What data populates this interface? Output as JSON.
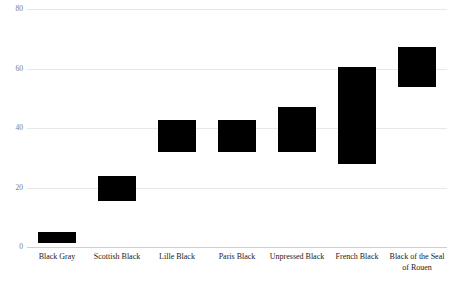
{
  "chart_data": {
    "type": "bar",
    "title": "",
    "subtitle": "",
    "xlabel": "",
    "ylabel": "",
    "ylim": [
      0,
      80
    ],
    "yticks": [
      0,
      20,
      40,
      60,
      80
    ],
    "grid": true,
    "legend": "none",
    "orientation": "vertical",
    "bar_style": "floating-range",
    "categories": [
      "Black Gray",
      "Scottish Black",
      "Lille Black",
      "Paris Black",
      "Unpressed Black",
      "French Black",
      "Black of the Seal of Rouen"
    ],
    "series": [
      {
        "name": "range-low",
        "values": [
          1.3,
          15.4,
          31.9,
          31.9,
          31.9,
          27.9,
          53.7
        ]
      },
      {
        "name": "range-high",
        "values": [
          5.0,
          23.8,
          42.6,
          42.6,
          47.0,
          60.4,
          67.1
        ]
      }
    ],
    "bar_color": "#000000",
    "grid_color": "#e8e8e8",
    "axis_color": "#d0d0d0",
    "tick_label_color": "#7a7a7a",
    "category_label_color": "#1a1a1a"
  },
  "footer": {
    "caption": ""
  }
}
